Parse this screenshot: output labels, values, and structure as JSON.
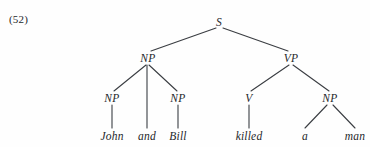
{
  "figure": {
    "example_number": "(52)",
    "type": "syntax-tree",
    "sentence": "John and Bill killed a man",
    "background_color": "#fefefe",
    "line_color": "#3a3d42",
    "text_color": "#25272b"
  },
  "nodes": [
    {
      "id": "s",
      "label": "S",
      "x": 219,
      "y": 22,
      "kind": "nonterminal"
    },
    {
      "id": "np1",
      "label": "NP",
      "x": 148,
      "y": 58,
      "kind": "nonterminal"
    },
    {
      "id": "vp",
      "label": "VP",
      "x": 291,
      "y": 58,
      "kind": "nonterminal"
    },
    {
      "id": "np2",
      "label": "NP",
      "x": 112,
      "y": 98,
      "kind": "nonterminal"
    },
    {
      "id": "np3",
      "label": "NP",
      "x": 178,
      "y": 98,
      "kind": "nonterminal"
    },
    {
      "id": "v",
      "label": "V",
      "x": 249,
      "y": 98,
      "kind": "nonterminal"
    },
    {
      "id": "np4",
      "label": "NP",
      "x": 330,
      "y": 98,
      "kind": "nonterminal"
    }
  ],
  "terminals": [
    {
      "id": "t-john",
      "label": "John",
      "x": 112,
      "y": 136
    },
    {
      "id": "t-and",
      "label": "and",
      "x": 147,
      "y": 136
    },
    {
      "id": "t-bill",
      "label": "Bill",
      "x": 178,
      "y": 136
    },
    {
      "id": "t-killed",
      "label": "killed",
      "x": 249,
      "y": 136
    },
    {
      "id": "t-a",
      "label": "a",
      "x": 305,
      "y": 136
    },
    {
      "id": "t-man",
      "label": "man",
      "x": 355,
      "y": 136
    }
  ],
  "edges": [
    {
      "from": "s",
      "to": "np1",
      "x1": 216,
      "y1": 28,
      "x2": 151,
      "y2": 51
    },
    {
      "from": "s",
      "to": "vp",
      "x1": 223,
      "y1": 28,
      "x2": 288,
      "y2": 51
    },
    {
      "from": "np1",
      "to": "np2",
      "x1": 146,
      "y1": 65,
      "x2": 114,
      "y2": 91
    },
    {
      "from": "np1",
      "to": "and",
      "x1": 147,
      "y1": 65,
      "x2": 147,
      "y2": 128
    },
    {
      "from": "np1",
      "to": "np3",
      "x1": 149,
      "y1": 65,
      "x2": 177,
      "y2": 91
    },
    {
      "from": "vp",
      "to": "v",
      "x1": 289,
      "y1": 65,
      "x2": 251,
      "y2": 91
    },
    {
      "from": "vp",
      "to": "np4",
      "x1": 293,
      "y1": 65,
      "x2": 329,
      "y2": 91
    },
    {
      "from": "np2",
      "to": "t-john",
      "x1": 112,
      "y1": 105,
      "x2": 112,
      "y2": 128
    },
    {
      "from": "np3",
      "to": "t-bill",
      "x1": 178,
      "y1": 105,
      "x2": 178,
      "y2": 128
    },
    {
      "from": "v",
      "to": "t-killed",
      "x1": 249,
      "y1": 105,
      "x2": 249,
      "y2": 128
    },
    {
      "from": "np4",
      "to": "t-a",
      "x1": 327,
      "y1": 105,
      "x2": 305,
      "y2": 128
    },
    {
      "from": "np4",
      "to": "t-man",
      "x1": 333,
      "y1": 105,
      "x2": 355,
      "y2": 128
    }
  ]
}
